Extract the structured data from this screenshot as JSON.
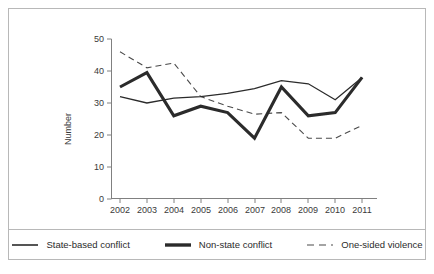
{
  "chart_data": {
    "type": "line",
    "title": "",
    "subtitle": "",
    "xlabel": "",
    "ylabel": "Number",
    "categories": [
      "2002",
      "2003",
      "2004",
      "2005",
      "2006",
      "2007",
      "2008",
      "2009",
      "2010",
      "2011"
    ],
    "x_tick_labels": [
      "2002",
      "2003",
      "2004",
      "2005",
      "2006",
      "2007",
      "2008",
      "2009",
      "2010",
      "2011"
    ],
    "y_tick_labels": [
      "0",
      "10",
      "20",
      "30",
      "40",
      "50"
    ],
    "y_ticks": [
      0,
      10,
      20,
      30,
      40,
      50
    ],
    "ylim": [
      0,
      50
    ],
    "grid": false,
    "legend_position": "bottom",
    "series": [
      {
        "name": "State-based conflict",
        "style": "solid-thin",
        "color": "#2b2b2b",
        "values": [
          32,
          30,
          31.5,
          32,
          33,
          34.5,
          37,
          36,
          31,
          38
        ]
      },
      {
        "name": "Non-state conflict",
        "style": "solid-thick",
        "color": "#2b2b2b",
        "values": [
          35,
          39.5,
          26,
          29,
          27,
          19,
          35,
          26,
          27,
          38
        ]
      },
      {
        "name": "One-sided violence",
        "style": "dashed",
        "color": "#4a4a4a",
        "values": [
          46,
          41,
          42.5,
          32,
          29,
          26.5,
          27,
          19,
          19,
          23
        ]
      }
    ]
  },
  "legend": {
    "items": [
      {
        "label": "State-based conflict"
      },
      {
        "label": "Non-state conflict"
      },
      {
        "label": "One-sided violence"
      }
    ]
  }
}
